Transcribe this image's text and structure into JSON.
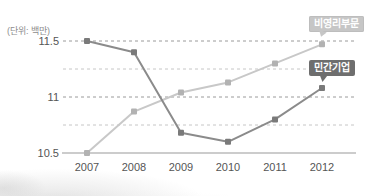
{
  "chart_data": {
    "type": "line",
    "title": "",
    "unit": "(단위: 백만)",
    "xlabel": "",
    "ylabel": "",
    "x": [
      2007,
      2008,
      2009,
      2010,
      2011,
      2012
    ],
    "series": [
      {
        "name": "비영리부문",
        "values": [
          10.5,
          10.87,
          11.04,
          11.13,
          11.3,
          11.47
        ],
        "line_color": "#c8c8c8",
        "point_color": "#b2b2b2",
        "label_style": "light callout badge"
      },
      {
        "name": "민간기업",
        "values": [
          11.5,
          11.4,
          10.68,
          10.6,
          10.8,
          11.08
        ],
        "line_color": "#8b8b8b",
        "point_color": "#7a7a7a",
        "label_style": "dark callout badge"
      }
    ],
    "ylim": [
      10.5,
      11.5
    ],
    "yticks": [
      10.5,
      11,
      11.5
    ],
    "ytick_labels": [
      "10.5",
      "11",
      "11.5"
    ],
    "grid_values": [
      10.75,
      11,
      11.25,
      11.5
    ],
    "grid": "horizontal dashed, minor lines lighter",
    "legend_position": "callout badges at top-right pointing to 2012 points"
  },
  "colors": {
    "grid_major": "#9a9a9a",
    "grid_minor": "#c6c6c6",
    "axis": "#999999",
    "tick_text": "#555555",
    "unit_text": "#8d8d8d",
    "badge_nonprofit_bg": "#c6c6c6",
    "badge_private_bg": "#6e6e6e",
    "badge_text": "#ffffff",
    "background": "#ffffff"
  }
}
